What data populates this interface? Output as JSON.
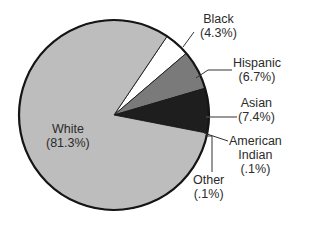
{
  "chart_data": {
    "type": "pie",
    "title": "",
    "categories": [
      "White",
      "Black",
      "Hispanic",
      "Asian",
      "American Indian",
      "Other"
    ],
    "values": [
      81.3,
      4.3,
      6.7,
      7.4,
      0.1,
      0.1
    ],
    "unit": "%",
    "start_angle_deg": -56,
    "direction": "clockwise",
    "slices": [
      {
        "name": "Black",
        "label": "Black",
        "pct_label": "(4.3%)",
        "value": 4.3,
        "color": "#ffffff"
      },
      {
        "name": "Hispanic",
        "label": "Hispanic",
        "pct_label": "(6.7%)",
        "value": 6.7,
        "color": "#7a7a7a"
      },
      {
        "name": "Asian",
        "label": "Asian",
        "pct_label": "(7.4%)",
        "value": 7.4,
        "color": "#1e1e1e"
      },
      {
        "name": "American Indian",
        "label": "American\nIndian",
        "pct_label": "(.1%)",
        "value": 0.1,
        "color": "#d8d8d8"
      },
      {
        "name": "Other",
        "label": "Other",
        "pct_label": "(.1%)",
        "value": 0.1,
        "color": "#555555"
      },
      {
        "name": "White",
        "label": "White",
        "pct_label": "(81.3%)",
        "value": 81.3,
        "color": "#bdbdbd"
      }
    ],
    "legend": "none (direct labels with leader lines)"
  },
  "labels": {
    "white": {
      "name": "White",
      "pct": "(81.3%)"
    },
    "black": {
      "name": "Black",
      "pct": "(4.3%)"
    },
    "hispanic": {
      "name": "Hispanic",
      "pct": "(6.7%)"
    },
    "asian": {
      "name": "Asian",
      "pct": "(7.4%)"
    },
    "american_indian": {
      "line1": "American",
      "line2": "Indian",
      "pct": "(.1%)"
    },
    "other": {
      "name": "Other",
      "pct": "(.1%)"
    }
  }
}
